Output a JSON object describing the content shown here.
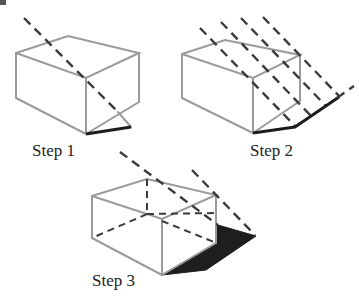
{
  "colors": {
    "background": "#ffffff",
    "box_edge": "#9a9a9a",
    "light_ray": "#3a3a3a",
    "shadow": "#1e1e1e"
  },
  "steps": [
    {
      "label": "Step 1",
      "description": "Single light ray from top corner projected to ground; first shadow edge drawn",
      "label_pos": [
        32,
        141
      ]
    },
    {
      "label": "Step 2",
      "description": "Parallel light rays from each top corner; shadow outline drawn on ground",
      "label_pos": [
        250,
        141
      ]
    },
    {
      "label": "Step 3",
      "description": "Hidden edges dashed; shadow area filled in black",
      "label_pos": [
        92,
        272
      ]
    }
  ]
}
